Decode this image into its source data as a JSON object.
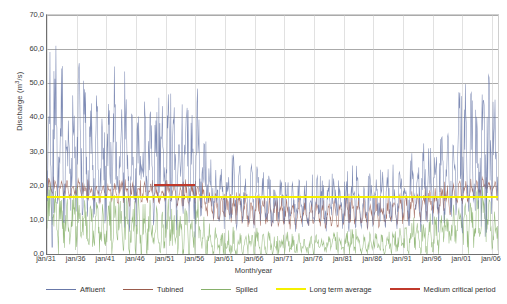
{
  "chart_data": {
    "type": "line",
    "title": "",
    "xlabel": "Month/year",
    "ylabel": "Discharge (m³/s)",
    "ylabel_text": "Discharge (m",
    "ylabel_sup": "3",
    "ylabel_tail": "/s)",
    "ylim": [
      0,
      70
    ],
    "ytick_step": 10,
    "ytick_labels": [
      "0,0",
      "10,0",
      "20,0",
      "30,0",
      "40,0",
      "50,0",
      "60,0",
      "70,0"
    ],
    "ytick_values": [
      0,
      10,
      20,
      30,
      40,
      50,
      60,
      70
    ],
    "xtick_labels": [
      "jan/31",
      "jan/36",
      "jan/41",
      "jan/46",
      "jan/51",
      "jan/56",
      "jan/61",
      "jan/66",
      "jan/71",
      "jan/76",
      "jan/81",
      "jan/86",
      "jan/91",
      "jan/96",
      "jan/01",
      "jan/06"
    ],
    "xtick_years": [
      1931,
      1936,
      1941,
      1946,
      1951,
      1956,
      1961,
      1966,
      1971,
      1976,
      1981,
      1986,
      1991,
      1996,
      2001,
      2006
    ],
    "x_range_years": [
      1931,
      2007
    ],
    "grid": "horizontal",
    "legend_position": "bottom",
    "series": [
      {
        "name": "Affluent",
        "color": "#6878a8",
        "description": "Monthly inflow discharge, highly variable, peaks up to ~70 m3/s in the 1930s-1950s, lower 1960s-1990s, rising again after 1996",
        "yearly_mean": [
          32,
          30,
          27,
          29,
          26,
          31,
          28,
          25,
          27,
          24,
          26,
          28,
          25,
          27,
          23,
          26,
          24,
          27,
          25,
          23,
          26,
          24,
          22,
          25,
          23,
          26,
          21,
          19,
          18,
          17,
          16,
          18,
          17,
          15,
          16,
          17,
          15,
          16,
          14,
          15,
          16,
          14,
          15,
          13,
          14,
          15,
          13,
          14,
          15,
          13,
          14,
          16,
          15,
          14,
          16,
          15,
          14,
          16,
          15,
          17,
          16,
          18,
          17,
          19,
          18,
          20,
          22,
          21,
          24,
          26,
          25,
          27,
          26,
          28,
          25,
          24
        ],
        "yearly_max": [
          58,
          70,
          52,
          55,
          48,
          62,
          50,
          44,
          47,
          42,
          46,
          50,
          44,
          48,
          40,
          46,
          42,
          48,
          44,
          40,
          46,
          41,
          38,
          44,
          40,
          46,
          34,
          30,
          28,
          26,
          25,
          28,
          26,
          23,
          25,
          26,
          23,
          25,
          22,
          23,
          25,
          22,
          23,
          20,
          22,
          23,
          20,
          22,
          23,
          20,
          22,
          25,
          23,
          22,
          25,
          23,
          22,
          25,
          24,
          27,
          26,
          30,
          28,
          33,
          30,
          34,
          38,
          36,
          42,
          48,
          45,
          52,
          50,
          60,
          46,
          44
        ]
      },
      {
        "name": "Tubined",
        "color": "#9a5b4c",
        "description": "Turbined discharge, capped near plant capacity ~20-22 m3/s",
        "yearly_mean": [
          19,
          19,
          18,
          19,
          18,
          19,
          18,
          17,
          18,
          17,
          18,
          18,
          17,
          18,
          17,
          18,
          17,
          18,
          17,
          17,
          18,
          17,
          16,
          17,
          17,
          18,
          15,
          14,
          13,
          13,
          12,
          13,
          13,
          12,
          12,
          13,
          12,
          12,
          11,
          12,
          12,
          11,
          12,
          11,
          11,
          12,
          11,
          11,
          12,
          11,
          12,
          12,
          12,
          11,
          12,
          12,
          11,
          12,
          12,
          13,
          12,
          14,
          13,
          14,
          14,
          15,
          16,
          15,
          17,
          18,
          18,
          19,
          19,
          20,
          19,
          18
        ],
        "yearly_max": [
          22,
          22,
          21,
          22,
          21,
          22,
          21,
          21,
          21,
          21,
          21,
          21,
          21,
          21,
          21,
          21,
          21,
          21,
          21,
          20,
          21,
          21,
          20,
          21,
          21,
          21,
          20,
          19,
          18,
          18,
          17,
          18,
          18,
          17,
          17,
          18,
          17,
          17,
          16,
          17,
          17,
          16,
          17,
          16,
          16,
          17,
          16,
          16,
          17,
          16,
          17,
          17,
          17,
          16,
          17,
          17,
          16,
          17,
          17,
          18,
          17,
          19,
          18,
          19,
          19,
          20,
          21,
          20,
          22,
          22,
          22,
          22,
          22,
          22,
          22,
          22
        ]
      },
      {
        "name": "Spilled",
        "color": "#86b06a",
        "description": "Spilled discharge, mostly 0-12 m3/s, occasional peaks",
        "yearly_mean": [
          11,
          10,
          8,
          9,
          7,
          11,
          9,
          6,
          8,
          6,
          7,
          9,
          7,
          8,
          5,
          8,
          6,
          8,
          7,
          5,
          8,
          6,
          5,
          7,
          5,
          8,
          4,
          3,
          3,
          2,
          2,
          3,
          2,
          2,
          2,
          3,
          2,
          3,
          2,
          2,
          3,
          2,
          3,
          2,
          2,
          3,
          2,
          3,
          3,
          2,
          3,
          3,
          3,
          2,
          3,
          3,
          2,
          3,
          3,
          4,
          3,
          5,
          4,
          5,
          5,
          6,
          7,
          6,
          8,
          9,
          8,
          10,
          9,
          11,
          8,
          7
        ],
        "yearly_max": [
          22,
          20,
          17,
          18,
          15,
          21,
          18,
          14,
          16,
          13,
          15,
          18,
          14,
          16,
          12,
          16,
          13,
          16,
          14,
          12,
          16,
          13,
          11,
          14,
          12,
          16,
          10,
          8,
          7,
          6,
          6,
          8,
          6,
          5,
          6,
          7,
          5,
          6,
          5,
          5,
          6,
          5,
          6,
          4,
          5,
          6,
          4,
          6,
          6,
          5,
          6,
          7,
          6,
          5,
          7,
          6,
          5,
          6,
          6,
          8,
          7,
          10,
          8,
          11,
          10,
          12,
          13,
          12,
          15,
          17,
          16,
          18,
          17,
          20,
          16,
          14
        ]
      }
    ],
    "reference_lines": [
      {
        "name": "Long term average",
        "value": 16.8,
        "color": "#f5f000",
        "span": "full"
      },
      {
        "name": "Medium critical period",
        "value": 20.2,
        "color": "#c0392b",
        "span": "1949-1956",
        "span_start_year": 1949,
        "span_end_year": 1956
      }
    ]
  },
  "legend": {
    "items": [
      {
        "label": "Affluent",
        "color": "#6878a8"
      },
      {
        "label": "Tubined",
        "color": "#9a5b4c"
      },
      {
        "label": "Spilled",
        "color": "#86b06a"
      },
      {
        "label": "Long term average",
        "color": "#f5f000"
      },
      {
        "label": "Medium critical period",
        "color": "#c0392b"
      }
    ]
  }
}
